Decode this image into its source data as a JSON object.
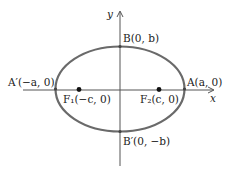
{
  "diagram": {
    "type": "ellipse-with-foci",
    "colors": {
      "ellipse": "#6a6a6a",
      "axis": "#555555",
      "point": "#111111",
      "text": "#222222"
    },
    "axes": {
      "x_label": "x",
      "y_label": "y"
    },
    "points": {
      "A_prime": "A′(−a, 0)",
      "A": "A(a, 0)",
      "B": "B(0, b)",
      "B_prime": "B′(0, −b)",
      "F1": "F₁(−c, 0)",
      "F2": "F₂(c, 0)"
    }
  }
}
